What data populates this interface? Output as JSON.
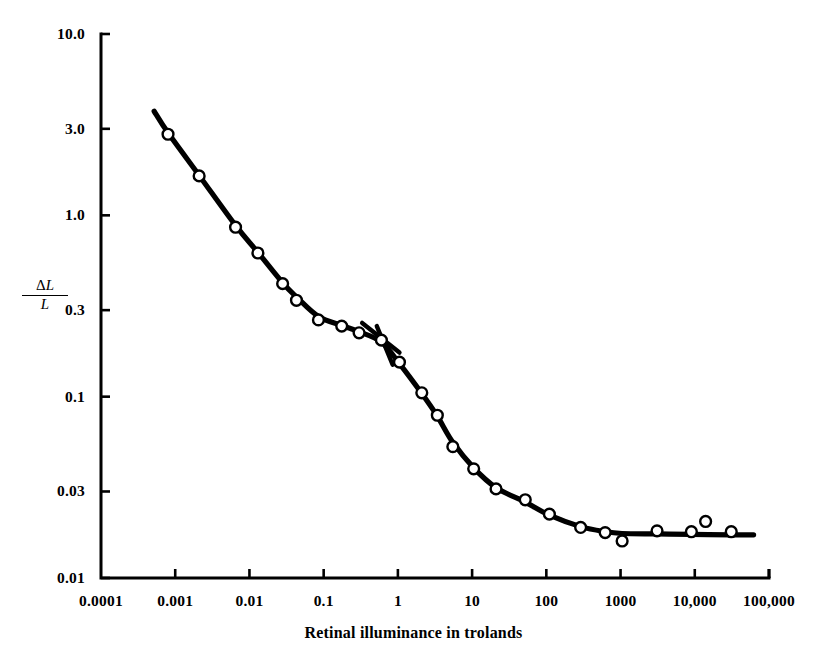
{
  "chart_data": {
    "type": "scatter",
    "title": "",
    "xlabel": "Retinal illuminance in trolands",
    "ylabel": "ΔL/L",
    "ylabel_numerator": "ΔL",
    "ylabel_denominator": "L",
    "xscale": "log",
    "yscale": "log",
    "xlim": [
      0.0001,
      100000
    ],
    "ylim": [
      0.01,
      10.0
    ],
    "grid": false,
    "legend": null,
    "xticks": [
      0.0001,
      0.001,
      0.01,
      0.1,
      1,
      10,
      100,
      1000,
      10000,
      100000
    ],
    "xtick_labels": [
      "0.0001",
      "0.001",
      "0.01",
      "0.1",
      "1",
      "10",
      "100",
      "1000",
      "10,000",
      "100,000"
    ],
    "yticks": [
      10.0,
      3.0,
      1.0,
      0.3,
      0.1,
      0.03,
      0.01
    ],
    "ytick_labels": [
      "10.0",
      "3.0",
      "1.0",
      "0.3",
      "0.1",
      "0.03",
      "0.01"
    ],
    "marker": "open-circle",
    "line_color": "#000000",
    "marker_edge_color": "#000000",
    "marker_face_color": "#ffffff",
    "points": [
      {
        "x": 0.0008,
        "y": 2.8
      },
      {
        "x": 0.0021,
        "y": 1.65
      },
      {
        "x": 0.0065,
        "y": 0.86
      },
      {
        "x": 0.013,
        "y": 0.62
      },
      {
        "x": 0.028,
        "y": 0.42
      },
      {
        "x": 0.043,
        "y": 0.34
      },
      {
        "x": 0.085,
        "y": 0.265
      },
      {
        "x": 0.175,
        "y": 0.245
      },
      {
        "x": 0.3,
        "y": 0.225
      },
      {
        "x": 0.6,
        "y": 0.205
      },
      {
        "x": 1.05,
        "y": 0.155
      },
      {
        "x": 2.1,
        "y": 0.105
      },
      {
        "x": 3.4,
        "y": 0.079
      },
      {
        "x": 5.5,
        "y": 0.053
      },
      {
        "x": 10.5,
        "y": 0.04
      },
      {
        "x": 21.0,
        "y": 0.031
      },
      {
        "x": 52.0,
        "y": 0.027
      },
      {
        "x": 110.0,
        "y": 0.0225
      },
      {
        "x": 290.0,
        "y": 0.019
      },
      {
        "x": 620.0,
        "y": 0.0178
      },
      {
        "x": 1050.0,
        "y": 0.016
      },
      {
        "x": 3100.0,
        "y": 0.0182
      },
      {
        "x": 9000.0,
        "y": 0.018
      },
      {
        "x": 14000.0,
        "y": 0.0205
      },
      {
        "x": 31000.0,
        "y": 0.018
      }
    ],
    "fit_curve": [
      {
        "x": 0.00052,
        "y": 3.75
      },
      {
        "x": 0.0008,
        "y": 2.85
      },
      {
        "x": 0.0021,
        "y": 1.66
      },
      {
        "x": 0.0065,
        "y": 0.88
      },
      {
        "x": 0.013,
        "y": 0.625
      },
      {
        "x": 0.028,
        "y": 0.425
      },
      {
        "x": 0.043,
        "y": 0.355
      },
      {
        "x": 0.085,
        "y": 0.277
      },
      {
        "x": 0.175,
        "y": 0.247
      },
      {
        "x": 0.3,
        "y": 0.228
      },
      {
        "x": 0.6,
        "y": 0.2
      },
      {
        "x": 1.05,
        "y": 0.152
      },
      {
        "x": 2.1,
        "y": 0.104
      },
      {
        "x": 3.4,
        "y": 0.078
      },
      {
        "x": 5.5,
        "y": 0.056
      },
      {
        "x": 10.5,
        "y": 0.0405
      },
      {
        "x": 21.0,
        "y": 0.0315
      },
      {
        "x": 52.0,
        "y": 0.0262
      },
      {
        "x": 110.0,
        "y": 0.0222
      },
      {
        "x": 290.0,
        "y": 0.0192
      },
      {
        "x": 620.0,
        "y": 0.018
      },
      {
        "x": 1050.0,
        "y": 0.0176
      },
      {
        "x": 3100.0,
        "y": 0.0175
      },
      {
        "x": 9000.0,
        "y": 0.0174
      },
      {
        "x": 31000.0,
        "y": 0.0173
      },
      {
        "x": 62000.0,
        "y": 0.0173
      }
    ],
    "annotations": [
      {
        "name": "slash-marker",
        "description": "short diagonal stroke crossing the curve",
        "x1": 0.33,
        "y1": 0.255,
        "x2": 1.05,
        "y2": 0.175
      },
      {
        "name": "slash-marker-tail",
        "description": "short diagonal stroke lower segment",
        "x1": 0.52,
        "y1": 0.245,
        "x2": 0.85,
        "y2": 0.15
      }
    ]
  },
  "axes": {
    "left_px": 101,
    "right_px": 769,
    "top_px": 34,
    "bottom_px": 578,
    "tick_length_px": 9,
    "axis_width_px": 3
  }
}
